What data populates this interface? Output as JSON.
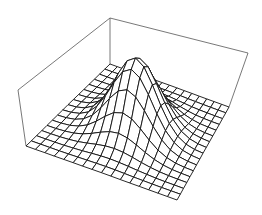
{
  "chart_data": {
    "type": "surface",
    "title": "",
    "xlabel": "",
    "ylabel": "",
    "zlabel": "",
    "grid_size": 16,
    "x_range": [
      -3,
      3
    ],
    "y_range": [
      -3,
      3
    ],
    "z_range": [
      0,
      1
    ],
    "peak": {
      "x": 0,
      "y": 0,
      "z": 1
    },
    "sigma": 0.9,
    "axes_ticks": false,
    "box": true,
    "colors": {
      "mesh_line": "#111111",
      "box_line": "#555555",
      "face": "#ffffff"
    }
  }
}
